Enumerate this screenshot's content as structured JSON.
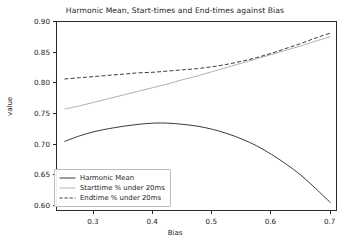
{
  "chart_data": {
    "type": "line",
    "title": "Harmonic Mean, Start-times and End-times against Bias",
    "xlabel": "Bias",
    "ylabel": "value",
    "xlim": [
      0.2375,
      0.7125
    ],
    "ylim": [
      0.59,
      0.9
    ],
    "xticks": [
      "0.3",
      "0.4",
      "0.5",
      "0.6",
      "0.7"
    ],
    "xtick_values": [
      0.3,
      0.4,
      0.5,
      0.6,
      0.7
    ],
    "yticks": [
      "0.60",
      "0.65",
      "0.70",
      "0.75",
      "0.80",
      "0.85",
      "0.90"
    ],
    "ytick_values": [
      0.6,
      0.65,
      0.7,
      0.75,
      0.8,
      0.85,
      0.9
    ],
    "grid": false,
    "legend_position": "lower left",
    "x": [
      0.25,
      0.275,
      0.3,
      0.325,
      0.35,
      0.375,
      0.4,
      0.425,
      0.45,
      0.475,
      0.5,
      0.525,
      0.55,
      0.575,
      0.6,
      0.625,
      0.65,
      0.675,
      0.7
    ],
    "series": [
      {
        "name": "Harmonic Mean",
        "style": "solid",
        "color": "#3b3b3b",
        "values": [
          0.705,
          0.714,
          0.721,
          0.726,
          0.73,
          0.733,
          0.735,
          0.735,
          0.733,
          0.73,
          0.725,
          0.718,
          0.709,
          0.698,
          0.684,
          0.668,
          0.65,
          0.628,
          0.605
        ]
      },
      {
        "name": "Starttime % under 20ms",
        "style": "solid",
        "color": "#b0b0b0",
        "values": [
          0.758,
          0.763,
          0.769,
          0.775,
          0.781,
          0.787,
          0.793,
          0.799,
          0.806,
          0.812,
          0.819,
          0.826,
          0.833,
          0.84,
          0.847,
          0.854,
          0.861,
          0.869,
          0.876
        ]
      },
      {
        "name": "Endtime % under 20ms",
        "style": "dashed",
        "color": "#3b3b3b",
        "values": [
          0.807,
          0.809,
          0.811,
          0.813,
          0.815,
          0.817,
          0.818,
          0.82,
          0.822,
          0.824,
          0.827,
          0.831,
          0.836,
          0.842,
          0.849,
          0.857,
          0.865,
          0.874,
          0.882
        ]
      }
    ]
  }
}
